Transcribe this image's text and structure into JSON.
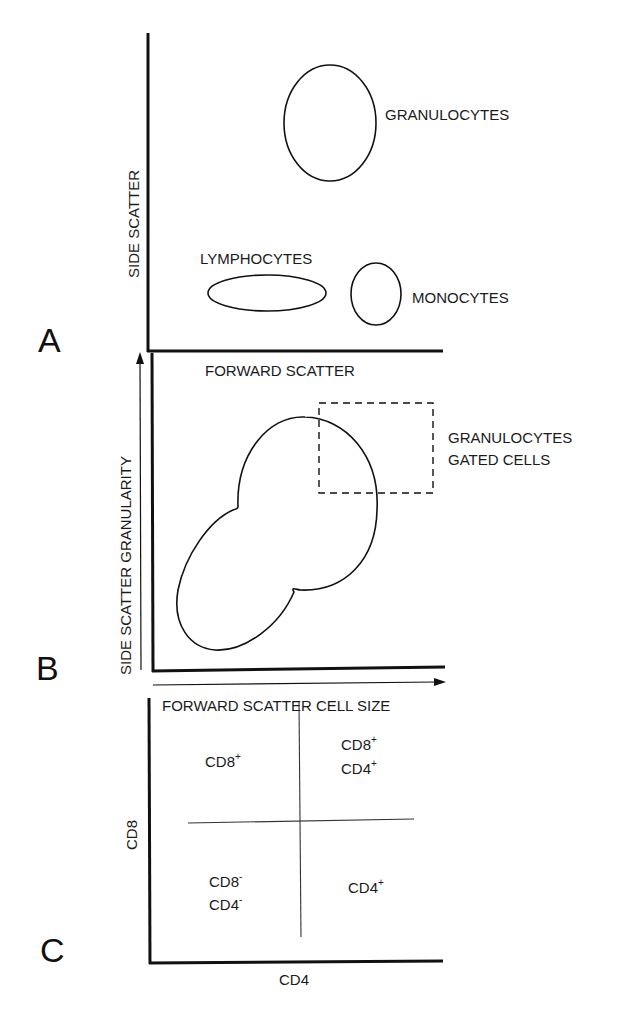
{
  "figure": {
    "panels": [
      {
        "letter": "A",
        "x_axis_label": "FORWARD SCATTER",
        "y_axis_label": "SIDE SCATTER",
        "populations": [
          {
            "label": "GRANULOCYTES",
            "shape": "ellipse"
          },
          {
            "label": "LYMPHOCYTES",
            "shape": "ellipse"
          },
          {
            "label": "MONOCYTES",
            "shape": "ellipse"
          }
        ]
      },
      {
        "letter": "B",
        "x_axis_label": "FORWARD SCATTER CELL SIZE",
        "y_axis_label": "SIDE SCATTER GRANULARITY",
        "gate_label_line1": "GRANULOCYTES",
        "gate_label_line2": "GATED CELLS"
      },
      {
        "letter": "C",
        "x_axis_label": "CD4",
        "y_axis_label": "CD8",
        "quadrants": {
          "upper_left": {
            "line1": "CD8",
            "line1_sup": "+"
          },
          "upper_right": {
            "line1": "CD8",
            "line1_sup": "+",
            "line2": "CD4",
            "line2_sup": "+"
          },
          "lower_left": {
            "line1": "CD8",
            "line1_sup": "-",
            "line2": "CD4",
            "line2_sup": "-"
          },
          "lower_right": {
            "line1": "CD4",
            "line1_sup": "+"
          }
        }
      }
    ]
  },
  "colors": {
    "ink": "#111111",
    "background": "#ffffff"
  }
}
